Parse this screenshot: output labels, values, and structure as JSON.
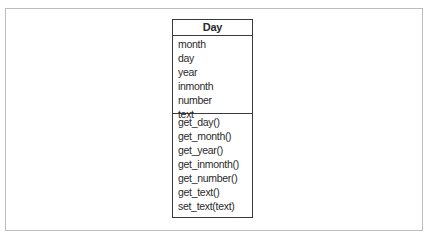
{
  "diagram": {
    "type": "uml-class",
    "class_name": "Day",
    "attributes": [
      "month",
      "day",
      "year",
      "inmonth",
      "number",
      "text"
    ],
    "methods": [
      "get_day()",
      "get_month()",
      "get_year()",
      "get_inmonth()",
      "get_number()",
      "get_text()",
      "set_text(text)"
    ]
  }
}
